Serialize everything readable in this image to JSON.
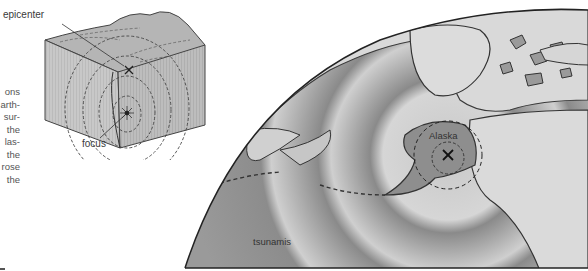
{
  "figure": {
    "block_diagram": {
      "labels": {
        "epicenter": "epicenter",
        "focus": "focus"
      }
    },
    "globe_map": {
      "labels": {
        "region": "Alaska",
        "waves": "tsunamis"
      }
    }
  },
  "body_text": {
    "line_fragments": [
      "ons",
      "arth-",
      "sur-",
      "the",
      "las-",
      "the",
      "rose",
      "the"
    ]
  },
  "colors": {
    "background": "#ffffff",
    "ocean": "#9a9a9a",
    "land": "#d8d8d8",
    "outline": "#3a3a3a",
    "block_face": "#c4c4c4",
    "block_top": "#b0b0b0"
  }
}
